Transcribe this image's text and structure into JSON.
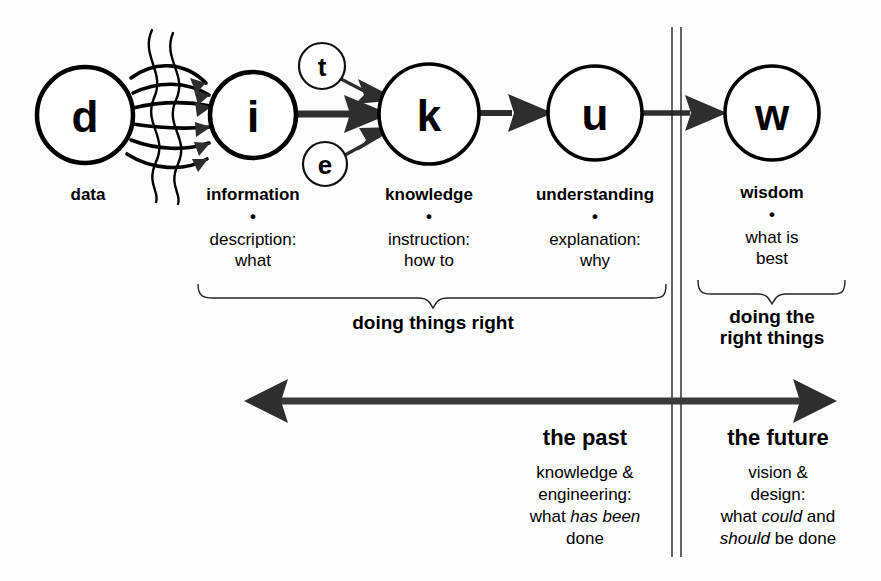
{
  "diagram": {
    "background": "#fdfdfd",
    "ink": "#000000",
    "arrow_fill": "#2e2e2e"
  },
  "nodes": [
    {
      "id": "d",
      "letter": "d",
      "cx": 85,
      "cy": 115,
      "r": 48,
      "label": "data"
    },
    {
      "id": "i",
      "letter": "i",
      "cx": 253,
      "cy": 115,
      "r": 43,
      "label": "information"
    },
    {
      "id": "k",
      "letter": "k",
      "cx": 429,
      "cy": 114,
      "r": 50,
      "label": "knowledge"
    },
    {
      "id": "u",
      "letter": "u",
      "cx": 595,
      "cy": 113,
      "r": 47,
      "label": "understanding"
    },
    {
      "id": "w",
      "letter": "w",
      "cx": 772,
      "cy": 113,
      "r": 47,
      "label": "wisdom"
    }
  ],
  "small_nodes": [
    {
      "id": "t",
      "letter": "t",
      "cx": 322,
      "cy": 66,
      "r": 23
    },
    {
      "id": "e",
      "letter": "e",
      "cx": 325,
      "cy": 164,
      "r": 22
    }
  ],
  "node_descriptions": [
    {
      "id": "i",
      "bullet": "•",
      "line1": "description:",
      "line2": "what",
      "x": 253
    },
    {
      "id": "k",
      "bullet": "•",
      "line1": "instruction:",
      "line2": "how to",
      "x": 429
    },
    {
      "id": "u",
      "bullet": "•",
      "line1": "explanation:",
      "line2": "why",
      "x": 595
    },
    {
      "id": "w",
      "bullet": "•",
      "line1": "what is",
      "line2": "best",
      "x": 772
    }
  ],
  "braces": [
    {
      "id": "left-brace",
      "caption_line1": "doing things right",
      "caption_line2": ""
    },
    {
      "id": "right-brace",
      "caption_line1": "doing the",
      "caption_line2": "right things"
    }
  ],
  "timeline": {
    "arrow_name": "past-future-axis",
    "left": {
      "heading": "the past",
      "lines": [
        {
          "segments": [
            {
              "text": "knowledge &",
              "italic": false
            }
          ]
        },
        {
          "segments": [
            {
              "text": "engineering:",
              "italic": false
            }
          ]
        },
        {
          "segments": [
            {
              "text": "what ",
              "italic": false
            },
            {
              "text": "has been",
              "italic": true
            }
          ]
        },
        {
          "segments": [
            {
              "text": "done",
              "italic": false
            }
          ]
        }
      ]
    },
    "right": {
      "heading": "the future",
      "lines": [
        {
          "segments": [
            {
              "text": "vision &",
              "italic": false
            }
          ]
        },
        {
          "segments": [
            {
              "text": "design:",
              "italic": false
            }
          ]
        },
        {
          "segments": [
            {
              "text": "what ",
              "italic": false
            },
            {
              "text": "could",
              "italic": true
            },
            {
              "text": " and",
              "italic": false
            }
          ]
        },
        {
          "segments": [
            {
              "text": "should",
              "italic": true
            },
            {
              "text": " be done",
              "italic": false
            }
          ]
        }
      ]
    }
  },
  "divider": {
    "name": "vertical-double-rule",
    "x": 676,
    "top": 27,
    "bottom": 557
  },
  "connectors": {
    "d_to_i": {
      "count": 6,
      "style": "curved-arrows-through-filter"
    },
    "filter": {
      "name": "wavy-filter-lines",
      "count": 2
    },
    "i_to_k": {
      "style": "solid-arrow"
    },
    "t_to_k": {
      "style": "thin-arrow"
    },
    "e_to_k": {
      "style": "thin-arrow"
    },
    "k_to_u": {
      "style": "solid-arrow"
    },
    "u_to_w": {
      "style": "solid-arrow"
    }
  }
}
